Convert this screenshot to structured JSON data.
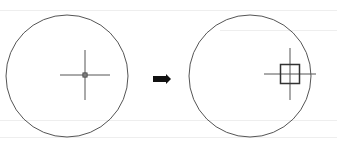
{
  "diagram": {
    "stroke_color": "#555555",
    "arrow_color": "#111111",
    "before": {
      "circle": {
        "cx": 67,
        "cy": 76,
        "r": 61
      },
      "crosshair": {
        "cx": 85,
        "cy": 75,
        "h_half": 25,
        "v_half": 25
      },
      "pickbox_size": 4
    },
    "arrow": {
      "x1": 153,
      "x2": 171,
      "y": 79
    },
    "after": {
      "circle": {
        "cx": 250,
        "cy": 76,
        "r": 61
      },
      "crosshair": {
        "cx": 290,
        "cy": 74,
        "h_half": 26,
        "v_half": 26
      },
      "pickbox_size": 19
    }
  }
}
